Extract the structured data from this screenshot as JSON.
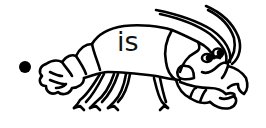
{
  "worksheet": {
    "word": "is",
    "bullet": "•",
    "illustration": "crayfish-icon",
    "colors": {
      "ink": "#000000",
      "background": "#ffffff"
    }
  }
}
